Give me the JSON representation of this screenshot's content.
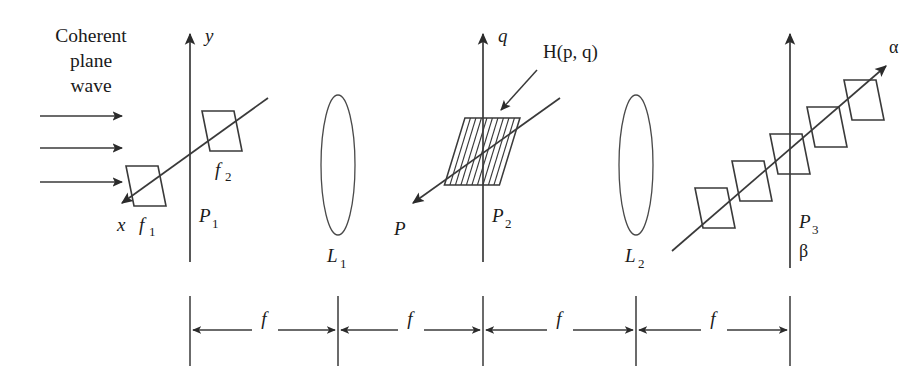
{
  "figure": {
    "source_label": "Coherent plane wave illumination through two lenses and a filter plane",
    "ink_color": "#1a1a1a",
    "stroke_color": "#3a3a3a",
    "background": "#ffffff"
  },
  "caption": {
    "lines": [
      "Coherent",
      "plane",
      "wave"
    ]
  },
  "input_beam": {
    "arrow_count": 3,
    "arrows": [
      {
        "x1": 40,
        "y1": 116,
        "x2": 126,
        "y2": 116
      },
      {
        "x1": 40,
        "y1": 148,
        "x2": 126,
        "y2": 148
      },
      {
        "x1": 40,
        "y1": 182,
        "x2": 126,
        "y2": 182
      }
    ]
  },
  "planes": [
    {
      "id": "P1",
      "label": "P",
      "subscript": "1",
      "x": 190,
      "label_x": 199,
      "label_y": 222,
      "axis_label": "y",
      "axis_label_x": 205,
      "axis_label_y": 42,
      "diag_label": "x",
      "diag_label_x": 117,
      "diag_label_y": 231
    },
    {
      "id": "P2",
      "label": "P",
      "subscript": "2",
      "x": 483,
      "label_x": 492,
      "label_y": 222,
      "axis_label": "q",
      "axis_label_x": 498,
      "axis_label_y": 42,
      "diag_label": "P",
      "diag_label_x": 394,
      "diag_label_y": 235
    },
    {
      "id": "P3",
      "label": "P",
      "subscript": "3",
      "x": 790,
      "label_x": 799,
      "label_y": 228,
      "axis_label": "",
      "axis_label_x": 0,
      "axis_label_y": 0,
      "diag_label": "",
      "diag_label_x": 0,
      "diag_label_y": 0
    }
  ],
  "lenses": [
    {
      "id": "L1",
      "label": "L",
      "subscript": "1",
      "cx": 338,
      "cy": 165,
      "rx": 17,
      "ry": 70,
      "label_x": 327,
      "label_y": 262
    },
    {
      "id": "L2",
      "label": "L",
      "subscript": "2",
      "cx": 636,
      "cy": 165,
      "rx": 17,
      "ry": 70,
      "label_x": 625,
      "label_y": 262
    }
  ],
  "object_plane_elements": {
    "parallelograms": [
      {
        "name": "f1",
        "label": "f",
        "subscript": "1",
        "cx": 146,
        "cy": 186,
        "label_x": 139,
        "label_y": 231
      },
      {
        "name": "f2",
        "label": "f",
        "subscript": "2",
        "cx": 222,
        "cy": 131,
        "label_x": 215,
        "label_y": 176
      }
    ]
  },
  "filter": {
    "name": "spatial-filter",
    "label": "H(p, q)",
    "label_x": 543,
    "label_y": 58,
    "hatch_count": 10,
    "cx": 483,
    "cy": 151,
    "pointer": {
      "x1": 536,
      "y1": 72,
      "x2": 500,
      "y2": 110
    }
  },
  "output_plane_elements": {
    "parallelogram_count": 5,
    "parallelograms": [
      {
        "cx": 715,
        "cy": 208
      },
      {
        "cx": 752,
        "cy": 181
      },
      {
        "cx": 790,
        "cy": 154
      },
      {
        "cx": 827,
        "cy": 127
      },
      {
        "cx": 864,
        "cy": 100
      }
    ],
    "alpha_label": "α",
    "alpha_label_x": 889,
    "alpha_label_y": 53,
    "beta_label": "β",
    "beta_label_x": 799,
    "beta_label_y": 257
  },
  "dimensions": {
    "baseline_y": 330,
    "tick_top": 296,
    "tick_bottom": 366,
    "segment_label": "f",
    "tick_positions": [
      190,
      338,
      483,
      636,
      790
    ],
    "segments": [
      {
        "label": "f",
        "x1": 190,
        "x2": 338,
        "label_x": 264,
        "label_y": 324
      },
      {
        "label": "f",
        "x1": 338,
        "x2": 483,
        "label_x": 410,
        "label_y": 324
      },
      {
        "label": "f",
        "x1": 483,
        "x2": 636,
        "label_x": 559,
        "label_y": 324
      },
      {
        "label": "f",
        "x1": 636,
        "x2": 790,
        "label_x": 713,
        "label_y": 324
      }
    ]
  }
}
